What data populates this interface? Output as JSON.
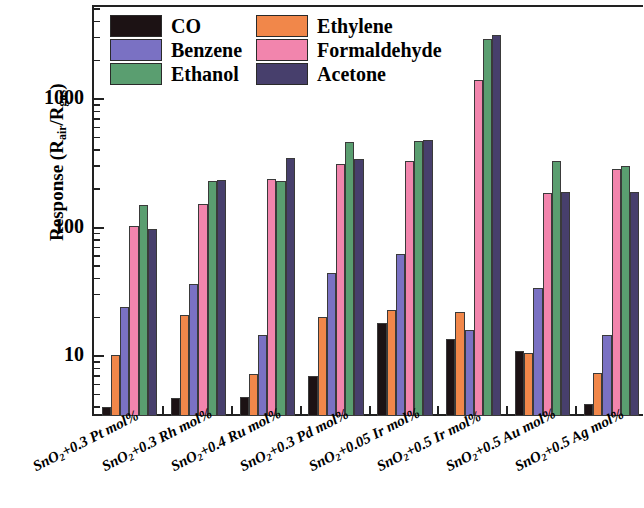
{
  "chart_data": {
    "type": "bar",
    "title": "",
    "xlabel": "",
    "ylabel": "Response (Rair/Rgas)",
    "ylabel_parts": {
      "prefix": "Response (R",
      "sub1": "air",
      "mid": "/R",
      "sub2": "gas",
      "suffix": ")"
    },
    "yscale": "log",
    "ylim": [
      3,
      4000
    ],
    "yticks": [
      10,
      100,
      1000
    ],
    "ytick_labels": [
      "10",
      "100",
      "1000"
    ],
    "grid": false,
    "legend_position": "top-left-inside",
    "categories": [
      "SnO2+0.3 Pt mol%",
      "SnO2+0.3 Rh mol%",
      "SnO2+0.4 Ru mol%",
      "SnO2+0.3 Pd mol%",
      "SnO2+0.05 Ir mol%",
      "SnO2+0.5 Ir mol%",
      "SnO2+0.5 Au mol%",
      "SnO2+0.5 Ag mol%"
    ],
    "category_parts": [
      {
        "pre": "SnO",
        "sub": "2",
        "post": "+0.3 Pt mol%"
      },
      {
        "pre": "SnO",
        "sub": "2",
        "post": "+0.3 Rh mol%"
      },
      {
        "pre": "SnO",
        "sub": "2",
        "post": "+0.4 Ru mol%"
      },
      {
        "pre": "SnO",
        "sub": "2",
        "post": "+0.3 Pd mol%"
      },
      {
        "pre": "SnO",
        "sub": "2",
        "post": "+0.05 Ir mol%"
      },
      {
        "pre": "SnO",
        "sub": "2",
        "post": "+0.5 Ir mol%"
      },
      {
        "pre": "SnO",
        "sub": "2",
        "post": "+0.5 Au mol%"
      },
      {
        "pre": "SnO",
        "sub": "2",
        "post": "+0.5 Ag mol%"
      }
    ],
    "series": [
      {
        "name": "CO",
        "color": "#1c1214",
        "values": [
          4.0,
          4.7,
          4.8,
          7.0,
          18.0,
          13.5,
          11.0,
          4.2
        ]
      },
      {
        "name": "Ethylene",
        "color": "#f1874a",
        "values": [
          10.2,
          21.0,
          7.3,
          20.0,
          23.0,
          22.0,
          10.5,
          7.4
        ]
      },
      {
        "name": "Benzene",
        "color": "#7a71c3",
        "values": [
          24.0,
          36.5,
          14.5,
          44.0,
          62.0,
          16.0,
          34.0,
          14.5
        ]
      },
      {
        "name": "Formaldehyde",
        "color": "#f285ad",
        "values": [
          102.0,
          152.0,
          240.0,
          310.0,
          330.0,
          1400.0,
          185.0,
          285.0
        ]
      },
      {
        "name": "Ethanol",
        "color": "#5a9e70",
        "values": [
          150.0,
          232.0,
          230.0,
          460.0,
          470.0,
          2950.0,
          330.0,
          300.0
        ]
      },
      {
        "name": "Acetone",
        "color": "#473f6c",
        "values": [
          97.0,
          236.0,
          350.0,
          340.0,
          480.0,
          3150.0,
          190.0,
          190.0
        ]
      }
    ]
  },
  "legend": {
    "entries": [
      {
        "label": "CO",
        "color": "#1c1214"
      },
      {
        "label": "Ethylene",
        "color": "#f1874a"
      },
      {
        "label": "Benzene",
        "color": "#7a71c3"
      },
      {
        "label": "Formaldehyde",
        "color": "#f285ad"
      },
      {
        "label": "Ethanol",
        "color": "#5a9e70"
      },
      {
        "label": "Acetone",
        "color": "#473f6c"
      }
    ]
  },
  "axis": {
    "y_title_prefix": "Response (R",
    "y_title_sub1": "air",
    "y_title_mid": "/R",
    "y_title_sub2": "gas",
    "y_title_suffix": ")"
  }
}
